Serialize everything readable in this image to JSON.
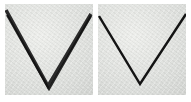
{
  "figure": {
    "panels": [
      {
        "id": "left",
        "shape": "v-shape",
        "stroke_style": "thick-double",
        "stroke_color": "#1a1a1a",
        "points": [
          [
            1,
            8
          ],
          [
            43,
            82
          ],
          [
            86,
            10
          ]
        ]
      },
      {
        "id": "right",
        "shape": "v-shape",
        "stroke_style": "thin-single",
        "stroke_color": "#141414",
        "points": [
          [
            1,
            12
          ],
          [
            42,
            80
          ],
          [
            88,
            10
          ]
        ]
      }
    ],
    "background_color": "#dfe0dd"
  }
}
